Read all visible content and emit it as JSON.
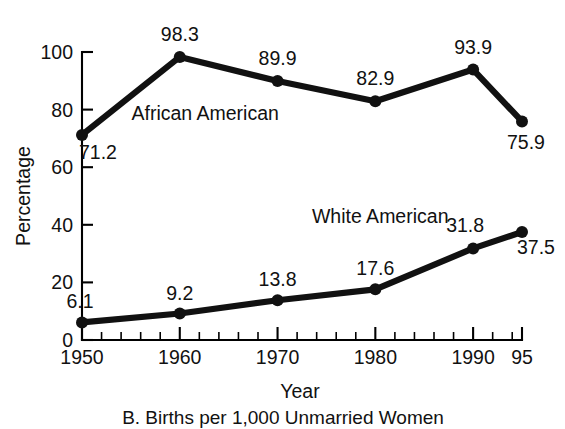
{
  "chart_data": {
    "type": "line",
    "title": "B. Births per 1,000 Unmarried Women",
    "xlabel": "Year",
    "ylabel": "Percentage",
    "x": [
      1950,
      1960,
      1970,
      1980,
      1990,
      1995
    ],
    "x_tick_labels": [
      "1950",
      "1960",
      "1970",
      "1980",
      "1990",
      "95"
    ],
    "y_tick_labels": [
      "0",
      "20",
      "40",
      "60",
      "80",
      "100"
    ],
    "y_ticks": [
      0,
      20,
      40,
      60,
      80,
      100
    ],
    "ylim": [
      0,
      100
    ],
    "xlim": [
      1950,
      1995
    ],
    "x_minor_tick_interval": 2,
    "grid": false,
    "legend": "inline-labels",
    "series": [
      {
        "name": "African American",
        "values": [
          71.2,
          98.3,
          89.9,
          82.9,
          93.9,
          75.9
        ],
        "point_labels": [
          "71.2",
          "98.3",
          "89.9",
          "82.9",
          "93.9",
          "75.9"
        ],
        "label_x": 1962.6,
        "label_y": 76.5,
        "color": "#111111"
      },
      {
        "name": "White American",
        "values": [
          6.1,
          9.2,
          13.8,
          17.6,
          31.8,
          37.5
        ],
        "point_labels": [
          "6.1",
          "9.2",
          "13.8",
          "17.6",
          "31.8",
          "37.5"
        ],
        "label_x": 1980.5,
        "label_y": 40.5,
        "color": "#111111"
      }
    ],
    "point_label_offsets": [
      [
        {
          "dx": 16,
          "dy": 24
        },
        {
          "dx": 0,
          "dy": -16
        },
        {
          "dx": 0,
          "dy": -16
        },
        {
          "dx": 0,
          "dy": -16
        },
        {
          "dx": 0,
          "dy": -16
        },
        {
          "dx": 4,
          "dy": 28
        }
      ],
      [
        {
          "dx": -2,
          "dy": -14
        },
        {
          "dx": 0,
          "dy": -14
        },
        {
          "dx": 0,
          "dy": -14
        },
        {
          "dx": 0,
          "dy": -14
        },
        {
          "dx": -8,
          "dy": -16
        },
        {
          "dx": 14,
          "dy": 22
        }
      ]
    ]
  }
}
